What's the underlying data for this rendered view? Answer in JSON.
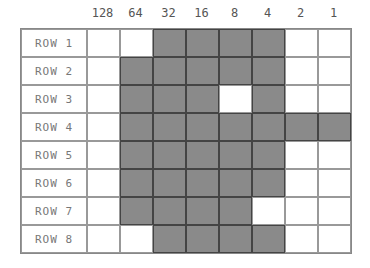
{
  "columns": [
    "128",
    "64",
    "32",
    "16",
    "8",
    "4",
    "2",
    "1"
  ],
  "rows": [
    {
      "label": "ROW 1",
      "bits": [
        0,
        0,
        1,
        1,
        1,
        1,
        0,
        0
      ]
    },
    {
      "label": "ROW 2",
      "bits": [
        0,
        1,
        1,
        1,
        1,
        1,
        0,
        0
      ]
    },
    {
      "label": "ROW 3",
      "bits": [
        0,
        1,
        1,
        1,
        0,
        1,
        0,
        0
      ]
    },
    {
      "label": "ROW 4",
      "bits": [
        0,
        1,
        1,
        1,
        1,
        1,
        1,
        1
      ]
    },
    {
      "label": "ROW 5",
      "bits": [
        0,
        1,
        1,
        1,
        1,
        1,
        0,
        0
      ]
    },
    {
      "label": "ROW 6",
      "bits": [
        0,
        1,
        1,
        1,
        1,
        1,
        0,
        0
      ]
    },
    {
      "label": "ROW 7",
      "bits": [
        0,
        1,
        1,
        1,
        1,
        0,
        0,
        0
      ]
    },
    {
      "label": "ROW 8",
      "bits": [
        0,
        0,
        1,
        1,
        1,
        1,
        0,
        0
      ]
    }
  ],
  "colors": {
    "filled": "#8a8a8a",
    "empty": "#ffffff"
  }
}
